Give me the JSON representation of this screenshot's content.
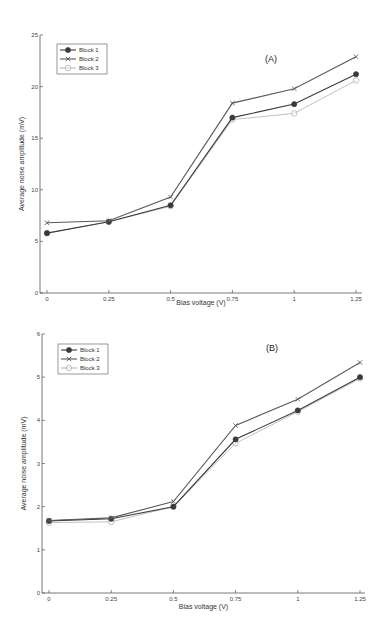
{
  "chart_data": [
    {
      "type": "line",
      "panel_label": "(A)",
      "title": "",
      "xlabel": "Bias voltage (V)",
      "ylabel": "Average noise amplitude (mV)",
      "x": [
        0,
        0.25,
        0.5,
        0.75,
        1,
        1.25
      ],
      "x_tick_labels": [
        "0",
        "0.25",
        "0.5",
        "0.75",
        "1",
        "1.25"
      ],
      "y_ticks": [
        0,
        5,
        10,
        15,
        20,
        25
      ],
      "y_tick_labels": [
        "0",
        "5",
        "10",
        "15",
        "20",
        "25"
      ],
      "ylim": [
        0,
        25
      ],
      "grid": false,
      "legend_position": "upper left",
      "series": [
        {
          "name": "Block 1",
          "marker": "filled-circle",
          "color": "#3a3a3a",
          "values": [
            5.8,
            6.9,
            8.5,
            17.0,
            18.3,
            21.2
          ]
        },
        {
          "name": "Block 2",
          "marker": "x-cross",
          "color": "#5a5a5a",
          "values": [
            6.8,
            7.0,
            9.3,
            18.4,
            19.8,
            22.9
          ]
        },
        {
          "name": "Block 3",
          "marker": "open-circle",
          "color": "#bbbbbb",
          "values": [
            5.8,
            6.9,
            8.4,
            16.8,
            17.4,
            20.6
          ]
        }
      ]
    },
    {
      "type": "line",
      "panel_label": "(B)",
      "title": "",
      "xlabel": "Bias voltage (V)",
      "ylabel": "Average noise amplitude (mV)",
      "x": [
        0,
        0.25,
        0.5,
        0.75,
        1,
        1.25
      ],
      "x_tick_labels": [
        "0",
        "0.25",
        "0.5",
        "0.75",
        "1",
        "1.25"
      ],
      "y_ticks": [
        0,
        1,
        2,
        3,
        4,
        5,
        6
      ],
      "y_tick_labels": [
        "0",
        "1",
        "2",
        "3",
        "4",
        "5",
        "6"
      ],
      "ylim": [
        0,
        6
      ],
      "grid": false,
      "legend_position": "upper left",
      "series": [
        {
          "name": "Block 1",
          "marker": "filled-circle",
          "color": "#3a3a3a",
          "values": [
            1.67,
            1.72,
            2.0,
            3.56,
            4.23,
            5.0
          ]
        },
        {
          "name": "Block 2",
          "marker": "x-cross",
          "color": "#5a5a5a",
          "values": [
            1.68,
            1.74,
            2.12,
            3.88,
            4.49,
            5.34
          ]
        },
        {
          "name": "Block 3",
          "marker": "open-circle",
          "color": "#bbbbbb",
          "values": [
            1.63,
            1.65,
            2.0,
            3.47,
            4.2,
            4.97
          ]
        }
      ]
    }
  ]
}
